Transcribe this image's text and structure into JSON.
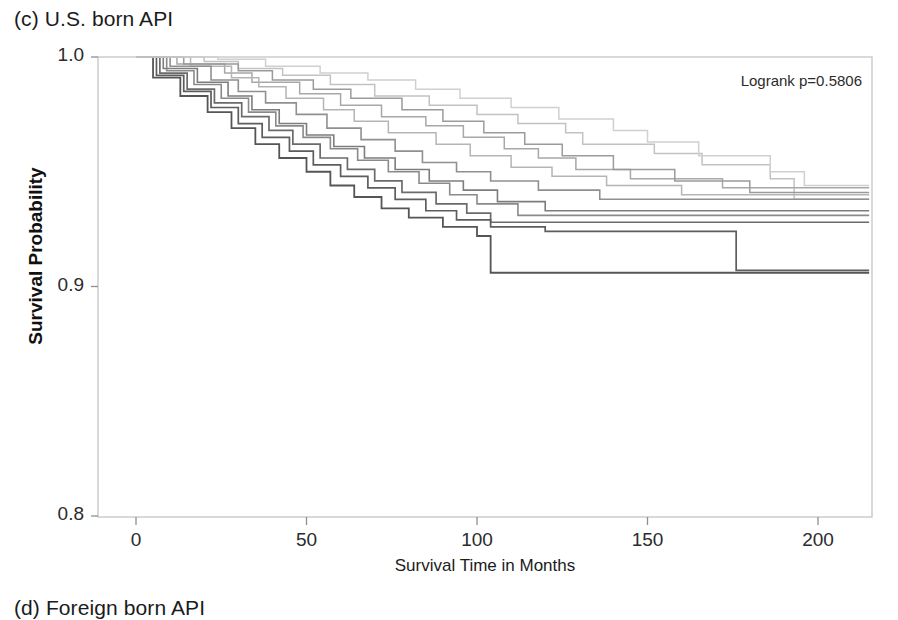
{
  "panel": {
    "title": "(c) U.S. born API",
    "next_panel_title": "(d) Foreign born API"
  },
  "annotation": {
    "logrank": "Logrank p=0.5806"
  },
  "chart_data": {
    "type": "line",
    "subtype": "kaplan-meier-step",
    "title": "(c) U.S. born API",
    "xlabel": "Survival Time in Months",
    "ylabel": "Survival Probability",
    "xlim": [
      -6,
      215
    ],
    "ylim": [
      0.8,
      1.0
    ],
    "xticks": [
      0,
      50,
      100,
      150,
      200
    ],
    "xtick_labels": [
      "0",
      "50",
      "100",
      "150",
      "200"
    ],
    "yticks": [
      0.8,
      0.9,
      1.0
    ],
    "ytick_labels": [
      "0.8",
      "0.9",
      "1.0"
    ],
    "grid": false,
    "legend": "none",
    "annotations": [
      "Logrank p=0.5806"
    ],
    "series": [
      {
        "name": "group-1",
        "color": "#c2c2c2",
        "width": 1.5,
        "points": [
          [
            0,
            1.0
          ],
          [
            20,
            0.998
          ],
          [
            30,
            0.995
          ],
          [
            43,
            0.992
          ],
          [
            57,
            0.988
          ],
          [
            70,
            0.983
          ],
          [
            86,
            0.979
          ],
          [
            100,
            0.975
          ],
          [
            112,
            0.971
          ],
          [
            126,
            0.967
          ],
          [
            131,
            0.962
          ],
          [
            152,
            0.958
          ],
          [
            166,
            0.953
          ],
          [
            186,
            0.947
          ],
          [
            193,
            0.938
          ],
          [
            215,
            0.938
          ]
        ]
      },
      {
        "name": "group-2",
        "color": "#a8a8a8",
        "width": 1.5,
        "points": [
          [
            0,
            1.0
          ],
          [
            12,
            0.997
          ],
          [
            26,
            0.993
          ],
          [
            34,
            0.989
          ],
          [
            48,
            0.984
          ],
          [
            60,
            0.979
          ],
          [
            72,
            0.974
          ],
          [
            85,
            0.97
          ],
          [
            96,
            0.965
          ],
          [
            108,
            0.96
          ],
          [
            118,
            0.956
          ],
          [
            129,
            0.951
          ],
          [
            145,
            0.947
          ],
          [
            172,
            0.943
          ],
          [
            215,
            0.943
          ]
        ]
      },
      {
        "name": "group-3",
        "color": "#b5b5b5",
        "width": 1.5,
        "points": [
          [
            0,
            1.0
          ],
          [
            16,
            0.996
          ],
          [
            28,
            0.991
          ],
          [
            36,
            0.987
          ],
          [
            44,
            0.982
          ],
          [
            55,
            0.977
          ],
          [
            64,
            0.972
          ],
          [
            74,
            0.967
          ],
          [
            88,
            0.962
          ],
          [
            98,
            0.957
          ],
          [
            110,
            0.952
          ],
          [
            122,
            0.948
          ],
          [
            138,
            0.944
          ],
          [
            160,
            0.94
          ],
          [
            215,
            0.94
          ]
        ]
      },
      {
        "name": "group-4",
        "color": "#909090",
        "width": 1.6,
        "points": [
          [
            0,
            1.0
          ],
          [
            10,
            0.996
          ],
          [
            22,
            0.99
          ],
          [
            30,
            0.985
          ],
          [
            38,
            0.98
          ],
          [
            47,
            0.975
          ],
          [
            56,
            0.969
          ],
          [
            66,
            0.964
          ],
          [
            76,
            0.959
          ],
          [
            84,
            0.954
          ],
          [
            94,
            0.95
          ],
          [
            104,
            0.946
          ],
          [
            118,
            0.942
          ],
          [
            136,
            0.938
          ],
          [
            215,
            0.938
          ]
        ]
      },
      {
        "name": "group-5",
        "color": "#7d7d7d",
        "width": 1.6,
        "points": [
          [
            0,
            1.0
          ],
          [
            8,
            0.995
          ],
          [
            18,
            0.989
          ],
          [
            27,
            0.983
          ],
          [
            34,
            0.977
          ],
          [
            42,
            0.971
          ],
          [
            50,
            0.966
          ],
          [
            58,
            0.961
          ],
          [
            67,
            0.956
          ],
          [
            76,
            0.951
          ],
          [
            86,
            0.946
          ],
          [
            96,
            0.942
          ],
          [
            106,
            0.937
          ],
          [
            120,
            0.933
          ],
          [
            215,
            0.933
          ]
        ]
      },
      {
        "name": "group-6",
        "color": "#8a8a8a",
        "width": 1.6,
        "points": [
          [
            0,
            1.0
          ],
          [
            9,
            0.994
          ],
          [
            17,
            0.988
          ],
          [
            25,
            0.982
          ],
          [
            33,
            0.976
          ],
          [
            41,
            0.97
          ],
          [
            49,
            0.965
          ],
          [
            57,
            0.96
          ],
          [
            65,
            0.955
          ],
          [
            74,
            0.95
          ],
          [
            83,
            0.945
          ],
          [
            92,
            0.94
          ],
          [
            100,
            0.936
          ],
          [
            112,
            0.931
          ],
          [
            215,
            0.931
          ]
        ]
      },
      {
        "name": "group-7",
        "color": "#6b6b6b",
        "width": 1.7,
        "points": [
          [
            0,
            1.0
          ],
          [
            7,
            0.993
          ],
          [
            15,
            0.986
          ],
          [
            23,
            0.98
          ],
          [
            31,
            0.974
          ],
          [
            39,
            0.968
          ],
          [
            46,
            0.962
          ],
          [
            54,
            0.956
          ],
          [
            62,
            0.951
          ],
          [
            70,
            0.946
          ],
          [
            78,
            0.941
          ],
          [
            88,
            0.936
          ],
          [
            97,
            0.932
          ],
          [
            104,
            0.928
          ],
          [
            215,
            0.928
          ]
        ]
      },
      {
        "name": "group-8",
        "color": "#5d5d5d",
        "width": 1.7,
        "points": [
          [
            0,
            1.0
          ],
          [
            6,
            0.992
          ],
          [
            14,
            0.985
          ],
          [
            22,
            0.978
          ],
          [
            30,
            0.971
          ],
          [
            37,
            0.965
          ],
          [
            45,
            0.959
          ],
          [
            52,
            0.953
          ],
          [
            60,
            0.948
          ],
          [
            68,
            0.943
          ],
          [
            76,
            0.938
          ],
          [
            85,
            0.933
          ],
          [
            94,
            0.929
          ],
          [
            104,
            0.926
          ],
          [
            120,
            0.924
          ],
          [
            172,
            0.924
          ],
          [
            176,
            0.907
          ],
          [
            215,
            0.907
          ]
        ]
      },
      {
        "name": "group-9",
        "color": "#555555",
        "width": 1.8,
        "points": [
          [
            0,
            1.0
          ],
          [
            5,
            0.991
          ],
          [
            13,
            0.983
          ],
          [
            21,
            0.976
          ],
          [
            28,
            0.969
          ],
          [
            35,
            0.962
          ],
          [
            42,
            0.956
          ],
          [
            50,
            0.95
          ],
          [
            57,
            0.944
          ],
          [
            64,
            0.939
          ],
          [
            72,
            0.934
          ],
          [
            80,
            0.93
          ],
          [
            90,
            0.926
          ],
          [
            100,
            0.922
          ],
          [
            104,
            0.906
          ],
          [
            215,
            0.906
          ]
        ]
      },
      {
        "name": "group-10",
        "color": "#9b9b9b",
        "width": 1.5,
        "points": [
          [
            0,
            1.0
          ],
          [
            14,
            0.997
          ],
          [
            30,
            0.994
          ],
          [
            40,
            0.99
          ],
          [
            52,
            0.986
          ],
          [
            63,
            0.982
          ],
          [
            78,
            0.977
          ],
          [
            90,
            0.972
          ],
          [
            102,
            0.967
          ],
          [
            114,
            0.962
          ],
          [
            125,
            0.957
          ],
          [
            140,
            0.951
          ],
          [
            158,
            0.946
          ],
          [
            180,
            0.941
          ],
          [
            215,
            0.941
          ]
        ]
      },
      {
        "name": "group-11",
        "color": "#d0d0d0",
        "width": 1.5,
        "points": [
          [
            0,
            1.0
          ],
          [
            24,
            0.999
          ],
          [
            38,
            0.996
          ],
          [
            54,
            0.993
          ],
          [
            68,
            0.99
          ],
          [
            82,
            0.986
          ],
          [
            95,
            0.982
          ],
          [
            110,
            0.978
          ],
          [
            124,
            0.973
          ],
          [
            140,
            0.968
          ],
          [
            150,
            0.963
          ],
          [
            165,
            0.957
          ],
          [
            186,
            0.95
          ],
          [
            196,
            0.944
          ],
          [
            215,
            0.944
          ]
        ]
      }
    ]
  }
}
